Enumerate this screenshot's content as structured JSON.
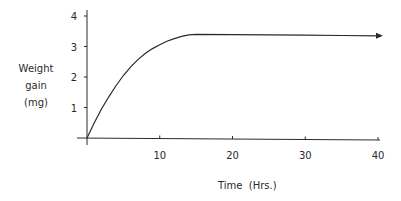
{
  "chart_data": {
    "type": "line",
    "title": "",
    "xlabel": "Time  (Hrs.)",
    "ylabel_lines": [
      "Weight",
      "gain",
      "(mg)"
    ],
    "ylabel": "Weight gain (mg)",
    "xlim": [
      0,
      40
    ],
    "ylim": [
      0,
      4
    ],
    "x_ticks": [
      10,
      20,
      30,
      40
    ],
    "x_tick_labels": [
      "10",
      "20",
      "30",
      "40"
    ],
    "y_ticks": [
      1,
      2,
      3,
      4
    ],
    "y_tick_labels": [
      "1",
      "2",
      "3",
      "4"
    ],
    "grid": false,
    "legend": null,
    "annotations": [
      "arrowhead at end of plateau indicating continuation"
    ],
    "series": [
      {
        "name": "Weight gain",
        "x": [
          0,
          1,
          2,
          3,
          4,
          5,
          6,
          7,
          8,
          9,
          10,
          11,
          12,
          13,
          14,
          15,
          20,
          25,
          30,
          35,
          40
        ],
        "values": [
          0,
          0.5,
          0.95,
          1.35,
          1.72,
          2.05,
          2.33,
          2.57,
          2.77,
          2.93,
          3.06,
          3.17,
          3.26,
          3.33,
          3.38,
          3.4,
          3.39,
          3.38,
          3.37,
          3.36,
          3.35
        ]
      }
    ]
  },
  "colors": {
    "line": "#2a2a2a",
    "text": "#2a2a2a",
    "background": "#ffffff"
  }
}
